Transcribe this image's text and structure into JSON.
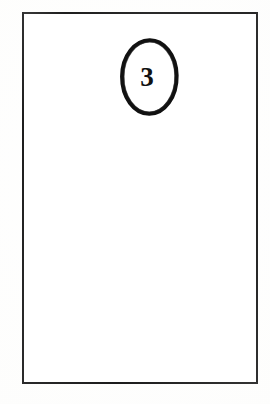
{
  "document": {
    "type": "scanned-page",
    "page_background_color": "#fcfcfb",
    "ink_color": "#1e1e1e"
  },
  "frame": {
    "name": "page-border",
    "border_color": "#2c2c2c",
    "fill_color": "#ffffff",
    "content": ""
  },
  "figure_marker": {
    "label": "3",
    "shape": "ellipse",
    "stroke_color": "#111111",
    "text_color": "#111111",
    "accessible_name": "Figure marker 3"
  }
}
